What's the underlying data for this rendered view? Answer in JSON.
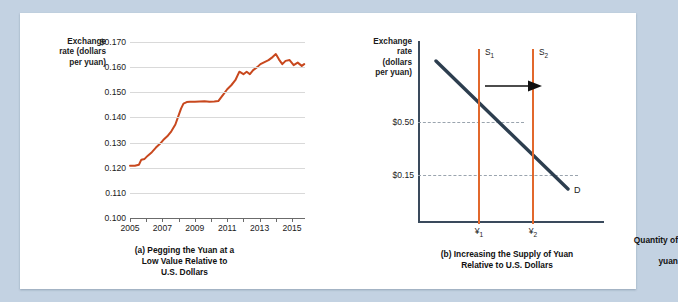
{
  "figure": {
    "background_color": "#c3d2e2",
    "card_color": "#ffffff",
    "line_color": "#c8481e",
    "supply_color": "#e2682c",
    "demand_color": "#2d3e4f",
    "grid_color": "#d9d9d9"
  },
  "panel_a": {
    "y_axis_title": "Exchange\nrate (dollars\nper yuan)",
    "caption": "(a) Pegging the Yuan at a\nLow Value Relative to\nU.S. Dollars",
    "caption_line1": "(a) Pegging the Yuan at a",
    "caption_line2": "Low Value Relative to",
    "caption_line3": "U.S. Dollars"
  },
  "panel_b": {
    "y_axis_title": "Exchange\nrate\n(dollars\nper yuan)",
    "x_axis_title": "Quantity of\nyuan",
    "x_axis_title_line1": "Quantity of",
    "x_axis_title_line2": "yuan",
    "caption_line1": "(b) Increasing the Supply of Yuan",
    "caption_line2": "Relative to U.S. Dollars",
    "y_labels": [
      "$0.50",
      "$0.15"
    ],
    "supply_labels": [
      "S",
      "S"
    ],
    "supply_label_1": "S",
    "supply_label_1_sub": "1",
    "supply_label_2": "S",
    "supply_label_2_sub": "2",
    "demand_label": "D",
    "x_labels": [
      "¥",
      "¥"
    ],
    "x_label_1": "¥",
    "x_label_1_sub": "1",
    "x_label_2": "¥",
    "x_label_2_sub": "2"
  },
  "chart_data": [
    {
      "type": "line",
      "panel": "a",
      "title": "(a) Pegging the Yuan at a Low Value Relative to U.S. Dollars",
      "xlabel": "",
      "ylabel": "Exchange rate (dollars per yuan)",
      "ylim": [
        0.1,
        0.17
      ],
      "xlim": [
        2005,
        2015.8
      ],
      "grid": true,
      "legend": "none",
      "y_ticks": [
        0.1,
        0.11,
        0.12,
        0.13,
        0.14,
        0.15,
        0.16,
        0.17
      ],
      "y_tick_labels": [
        "0.100",
        "0.110",
        "0.120",
        "0.130",
        "0.140",
        "0.150",
        "0.160",
        "$0.170"
      ],
      "x_ticks": [
        2005,
        2006,
        2007,
        2008,
        2009,
        2010,
        2011,
        2012,
        2013,
        2014,
        2015
      ],
      "x_tick_labels": [
        "2005",
        "",
        "2007",
        "",
        "2009",
        "",
        "2011",
        "",
        "2013",
        "",
        "2015"
      ],
      "series": [
        {
          "name": "Yuan-dollar exchange rate",
          "color": "#c8481e",
          "x": [
            2005.0,
            2005.3,
            2005.55,
            2005.7,
            2005.9,
            2006.1,
            2006.35,
            2006.6,
            2006.85,
            2007.05,
            2007.3,
            2007.55,
            2007.8,
            2008.0,
            2008.15,
            2008.3,
            2008.5,
            2008.7,
            2009.0,
            2009.3,
            2009.6,
            2009.9,
            2010.2,
            2010.45,
            2010.6,
            2010.8,
            2011.0,
            2011.25,
            2011.5,
            2011.75,
            2012.0,
            2012.2,
            2012.4,
            2012.6,
            2012.85,
            2013.05,
            2013.3,
            2013.55,
            2013.8,
            2014.0,
            2014.2,
            2014.4,
            2014.6,
            2014.85,
            2015.1,
            2015.35,
            2015.6,
            2015.75
          ],
          "y": [
            0.1208,
            0.1208,
            0.1212,
            0.1232,
            0.1235,
            0.1248,
            0.1262,
            0.128,
            0.1295,
            0.131,
            0.1325,
            0.1345,
            0.1372,
            0.1408,
            0.1435,
            0.1455,
            0.1461,
            0.1462,
            0.1462,
            0.1463,
            0.1464,
            0.1462,
            0.1463,
            0.1465,
            0.1478,
            0.1495,
            0.1512,
            0.1528,
            0.1548,
            0.1582,
            0.1572,
            0.1582,
            0.1572,
            0.1588,
            0.16,
            0.1612,
            0.162,
            0.1628,
            0.164,
            0.1652,
            0.163,
            0.1612,
            0.1625,
            0.1628,
            0.1608,
            0.1618,
            0.1605,
            0.1612
          ]
        }
      ]
    },
    {
      "type": "line",
      "panel": "b",
      "title": "(b) Increasing the Supply of Yuan Relative to U.S. Dollars",
      "xlabel": "Quantity of yuan",
      "ylabel": "Exchange rate (dollars per yuan)",
      "grid": false,
      "legend": "none",
      "annotations": [
        "S1",
        "S2",
        "D",
        "shift-arrow"
      ],
      "series": [
        {
          "name": "Demand",
          "color": "#2d3e4f",
          "type": "line",
          "x": [
            0.1,
            0.8
          ],
          "y": [
            0.88,
            0.18
          ]
        },
        {
          "name": "Supply 1",
          "color": "#e2682c",
          "type": "vline",
          "x": 0.33
        },
        {
          "name": "Supply 2",
          "color": "#e2682c",
          "type": "vline",
          "x": 0.62
        }
      ],
      "marked_prices": [
        {
          "label": "$0.50",
          "y_frac": 0.555
        },
        {
          "label": "$0.15",
          "y_frac": 0.265
        }
      ],
      "marked_quantities": [
        {
          "label": "¥1",
          "x_frac": 0.33
        },
        {
          "label": "¥2",
          "x_frac": 0.62
        }
      ]
    }
  ]
}
